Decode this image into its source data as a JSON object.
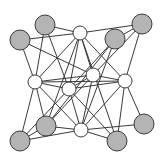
{
  "diagram": {
    "type": "graph",
    "colors": {
      "background": "#ffffff",
      "edge": "#3a3a3a",
      "gray_node_fill": "#b4b4b4",
      "white_node_fill": "#ffffff",
      "node_stroke": "#3a3a3a"
    },
    "nodes": [
      {
        "id": "G1",
        "x": 45,
        "y": 25,
        "r": 10,
        "kind": "gray"
      },
      {
        "id": "G2",
        "x": 20,
        "y": 40,
        "r": 10,
        "kind": "gray"
      },
      {
        "id": "W1",
        "x": 80,
        "y": 33,
        "r": 7,
        "kind": "white"
      },
      {
        "id": "G3",
        "x": 115,
        "y": 39,
        "r": 10,
        "kind": "gray"
      },
      {
        "id": "G4",
        "x": 142,
        "y": 24,
        "r": 10,
        "kind": "gray"
      },
      {
        "id": "W2",
        "x": 35,
        "y": 82,
        "r": 7,
        "kind": "white"
      },
      {
        "id": "W3",
        "x": 69,
        "y": 89,
        "r": 7,
        "kind": "white"
      },
      {
        "id": "W4",
        "x": 93,
        "y": 75,
        "r": 7,
        "kind": "white"
      },
      {
        "id": "W5",
        "x": 125,
        "y": 81,
        "r": 7,
        "kind": "white"
      },
      {
        "id": "G5",
        "x": 46,
        "y": 126,
        "r": 10,
        "kind": "gray"
      },
      {
        "id": "G6",
        "x": 20,
        "y": 141,
        "r": 10,
        "kind": "gray"
      },
      {
        "id": "W6",
        "x": 81,
        "y": 130,
        "r": 7,
        "kind": "white"
      },
      {
        "id": "G7",
        "x": 117,
        "y": 141,
        "r": 10,
        "kind": "gray"
      },
      {
        "id": "G8",
        "x": 144,
        "y": 124,
        "r": 10,
        "kind": "gray"
      }
    ],
    "edges": [
      [
        "G2",
        "W1"
      ],
      [
        "G1",
        "W1"
      ],
      [
        "W1",
        "G4"
      ],
      [
        "G2",
        "W2"
      ],
      [
        "G2",
        "W4"
      ],
      [
        "G1",
        "W2"
      ],
      [
        "G1",
        "W3"
      ],
      [
        "W1",
        "W2"
      ],
      [
        "W1",
        "W3"
      ],
      [
        "W1",
        "W4"
      ],
      [
        "W1",
        "W5"
      ],
      [
        "W1",
        "G7"
      ],
      [
        "W1",
        "G5"
      ],
      [
        "G3",
        "W3"
      ],
      [
        "G3",
        "W6"
      ],
      [
        "G3",
        "G5"
      ],
      [
        "G4",
        "W5"
      ],
      [
        "G4",
        "W4"
      ],
      [
        "G4",
        "G3"
      ],
      [
        "W2",
        "W3"
      ],
      [
        "W2",
        "W4"
      ],
      [
        "W2",
        "W5"
      ],
      [
        "W2",
        "G5"
      ],
      [
        "W2",
        "G6"
      ],
      [
        "W2",
        "W6"
      ],
      [
        "W3",
        "W4"
      ],
      [
        "W3",
        "W5"
      ],
      [
        "W3",
        "W6"
      ],
      [
        "W3",
        "G7"
      ],
      [
        "W3",
        "G6"
      ],
      [
        "W4",
        "W5"
      ],
      [
        "W4",
        "W6"
      ],
      [
        "W4",
        "G5"
      ],
      [
        "W5",
        "W6"
      ],
      [
        "W5",
        "G8"
      ],
      [
        "W5",
        "G7"
      ],
      [
        "G5",
        "W6"
      ],
      [
        "G6",
        "W6"
      ],
      [
        "W6",
        "G7"
      ],
      [
        "W6",
        "G8"
      ],
      [
        "G6",
        "G5"
      ]
    ]
  }
}
